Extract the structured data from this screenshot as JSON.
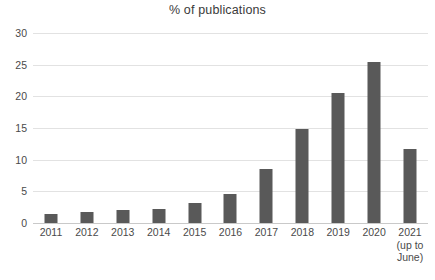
{
  "chart_data": {
    "type": "bar",
    "title": "% of publications",
    "subtitle": "",
    "xlabel": "",
    "ylabel": "",
    "categories": [
      "2011",
      "2012",
      "2013",
      "2014",
      "2015",
      "2016",
      "2017",
      "2018",
      "2019",
      "2020",
      "2021"
    ],
    "category_sublabels": [
      "",
      "",
      "",
      "",
      "",
      "",
      "",
      "",
      "",
      "",
      "(up to\nJune)"
    ],
    "values": [
      1.5,
      1.7,
      2.0,
      2.2,
      3.1,
      4.6,
      8.5,
      14.8,
      20.5,
      25.4,
      11.7
    ],
    "ylim": [
      0,
      30
    ],
    "yticks": [
      0,
      5,
      10,
      15,
      20,
      25,
      30
    ],
    "ytick_labels": [
      "0",
      "5",
      "10",
      "15",
      "20",
      "25",
      "30"
    ],
    "grid": true,
    "grid_axis": "y",
    "legend": false,
    "legend_position": "none",
    "bar_color": "#595959",
    "gridline_color": "#e2e2e2",
    "axis_color": "#c9c9c9",
    "background_color": "#ffffff",
    "text_color": "#4a4a4a"
  },
  "x_labels": [
    {
      "year": "2011",
      "note_line1": "",
      "note_line2": ""
    },
    {
      "year": "2012",
      "note_line1": "",
      "note_line2": ""
    },
    {
      "year": "2013",
      "note_line1": "",
      "note_line2": ""
    },
    {
      "year": "2014",
      "note_line1": "",
      "note_line2": ""
    },
    {
      "year": "2015",
      "note_line1": "",
      "note_line2": ""
    },
    {
      "year": "2016",
      "note_line1": "",
      "note_line2": ""
    },
    {
      "year": "2017",
      "note_line1": "",
      "note_line2": ""
    },
    {
      "year": "2018",
      "note_line1": "",
      "note_line2": ""
    },
    {
      "year": "2019",
      "note_line1": "",
      "note_line2": ""
    },
    {
      "year": "2020",
      "note_line1": "",
      "note_line2": ""
    },
    {
      "year": "2021",
      "note_line1": "(up to",
      "note_line2": "June)"
    }
  ]
}
